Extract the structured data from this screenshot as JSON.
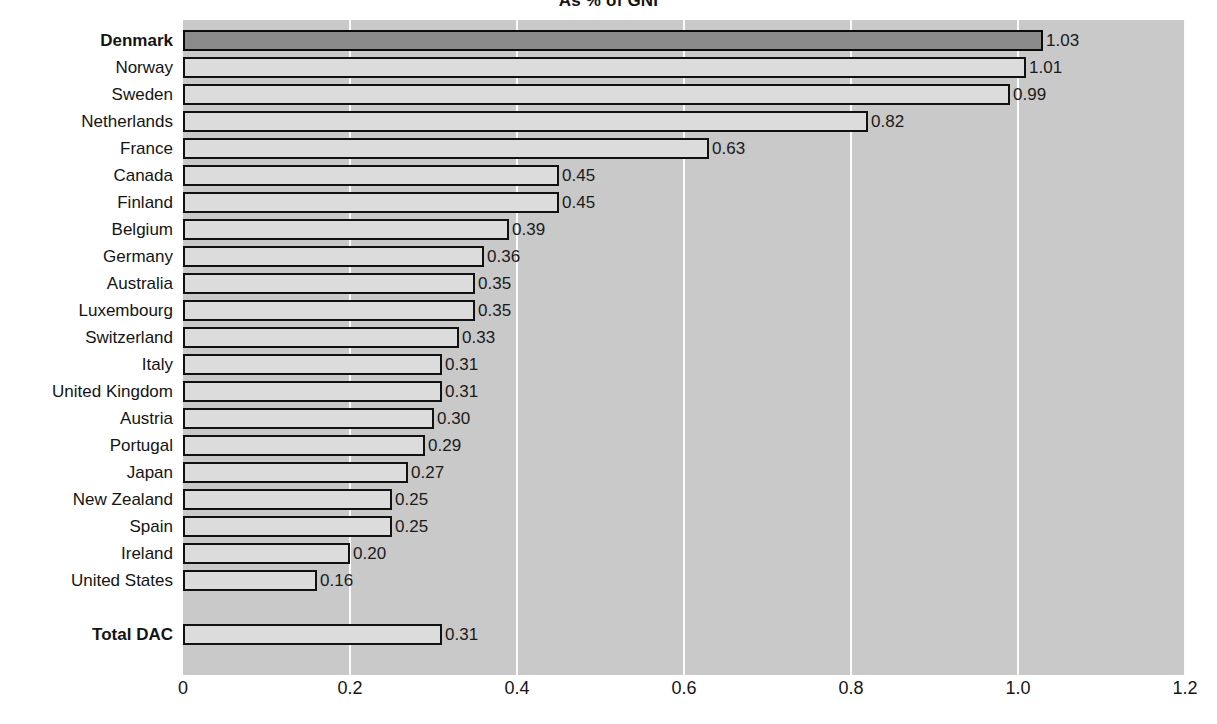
{
  "chart_data": {
    "type": "bar",
    "orientation": "horizontal",
    "title": "As % of GNI",
    "xlabel": "",
    "ylabel": "",
    "xlim": [
      0,
      1.2
    ],
    "xticks": [
      "0",
      "0.2",
      "0.4",
      "0.6",
      "0.8",
      "1.0",
      "1.2"
    ],
    "xtick_values": [
      0,
      0.2,
      0.4,
      0.6,
      0.8,
      1.0,
      1.2
    ],
    "grid": true,
    "gridline_color": "#fbfbfb",
    "plot_background": "#c9c9c9",
    "bar_fill": "#dcdcdc",
    "bar_highlight_fill": "#8b8b8b",
    "bar_border": "#111111",
    "legend": null,
    "categories": [
      "Denmark",
      "Norway",
      "Sweden",
      "Netherlands",
      "France",
      "Canada",
      "Finland",
      "Belgium",
      "Germany",
      "Australia",
      "Luxembourg",
      "Switzerland",
      "Italy",
      "United Kingdom",
      "Austria",
      "Portugal",
      "Japan",
      "New Zealand",
      "Spain",
      "Ireland",
      "United States",
      "Total DAC"
    ],
    "values": [
      1.03,
      1.01,
      0.99,
      0.82,
      0.63,
      0.45,
      0.45,
      0.39,
      0.36,
      0.35,
      0.35,
      0.33,
      0.31,
      0.31,
      0.3,
      0.29,
      0.27,
      0.25,
      0.25,
      0.2,
      0.16,
      0.31
    ],
    "value_labels": [
      "1.03",
      "1.01",
      "0.99",
      "0.82",
      "0.63",
      "0.45",
      "0.45",
      "0.39",
      "0.36",
      "0.35",
      "0.35",
      "0.33",
      "0.31",
      "0.31",
      "0.30",
      "0.29",
      "0.27",
      "0.25",
      "0.25",
      "0.20",
      "0.16",
      "0.31"
    ],
    "highlighted": [
      "Denmark"
    ],
    "bold_labels": [
      "Denmark",
      "Total DAC"
    ],
    "separated_rows": [
      "Total DAC"
    ]
  }
}
